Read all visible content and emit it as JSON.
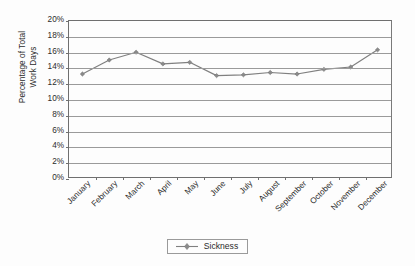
{
  "chart_data": {
    "type": "line",
    "title": "",
    "xlabel": "",
    "ylabel": "Percentage of Total Work Days",
    "ylabel_lines": [
      "Percentage of Total",
      "Work Days"
    ],
    "categories": [
      "January",
      "February",
      "March",
      "April",
      "May",
      "June",
      "July",
      "August",
      "September",
      "October",
      "November",
      "December"
    ],
    "series": [
      {
        "name": "Sickness",
        "values": [
          13.2,
          15.0,
          16.0,
          14.5,
          14.7,
          13.0,
          13.1,
          13.4,
          13.2,
          13.8,
          14.1,
          16.3
        ],
        "color": "#808080",
        "marker": "diamond"
      }
    ],
    "ylim": [
      0,
      20
    ],
    "ytick_step": 2,
    "ytick_labels": [
      "0%",
      "2%",
      "4%",
      "6%",
      "8%",
      "10%",
      "12%",
      "14%",
      "16%",
      "18%",
      "20%"
    ],
    "ytick_values": [
      0,
      2,
      4,
      6,
      8,
      10,
      12,
      14,
      16,
      18,
      20
    ],
    "grid": "horizontal",
    "legend_position": "bottom",
    "xlabel_rotation": -45,
    "value_suffix": "%"
  },
  "legend": {
    "entries": [
      {
        "label": "Sickness"
      }
    ]
  },
  "colors": {
    "series_line": "#808080",
    "gridline": "#9a9a9a",
    "axis": "#6f6f6f",
    "text": "#2b2b2b",
    "background": "#fdfdfd"
  }
}
